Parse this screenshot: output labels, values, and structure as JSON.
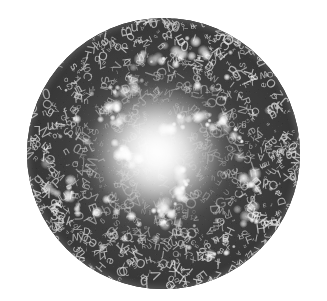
{
  "image": {
    "title": "Alphabet Galaxy",
    "subject": "spiral-galaxy-composed-of-letters",
    "medium": "grayscale photographic composite",
    "background_color": "#ffffff",
    "canvas": {
      "width": 327,
      "height": 301
    }
  },
  "disc": {
    "name": "galaxy-disc",
    "shape": "circle",
    "center_x": 164,
    "center_y": 153,
    "radius": 136,
    "rim_color": "#3a3a3a",
    "core_color": "#fdfdfd",
    "mid_color": "#9a9a9a"
  },
  "core": {
    "label": "luminous-core",
    "center_x_pct": 47,
    "center_y_pct": 49,
    "brightness": "near-white"
  },
  "glyphs": {
    "description": "scattered alphanumeric letterforms filling the disc",
    "characters": [
      "A",
      "B",
      "C",
      "D",
      "E",
      "F",
      "G",
      "H",
      "I",
      "J",
      "K",
      "L",
      "M",
      "N",
      "O",
      "P",
      "Q",
      "R",
      "S",
      "T",
      "U",
      "V",
      "W",
      "X",
      "Y",
      "Z",
      "a",
      "b",
      "c",
      "d",
      "e",
      "f",
      "g",
      "h",
      "i",
      "j",
      "k",
      "l",
      "m",
      "n",
      "o",
      "p",
      "q",
      "r",
      "s",
      "t",
      "u",
      "v",
      "w",
      "x",
      "y",
      "z",
      "2",
      "3",
      "5",
      "7",
      "0"
    ],
    "count": 1150,
    "color": "#e8e8e8",
    "min_size": 4,
    "max_size": 15
  },
  "star_blobs": {
    "description": "bright white star-cluster blobs tracing spiral arms",
    "count": 130,
    "color": "#ffffff",
    "arms": 3
  },
  "palette": {
    "white": "#ffffff",
    "core_glow": "#fafafa",
    "mid_gray": "#8e8e8e",
    "dark_gray": "#3a3a3a",
    "rim_shadow": "#202020"
  }
}
